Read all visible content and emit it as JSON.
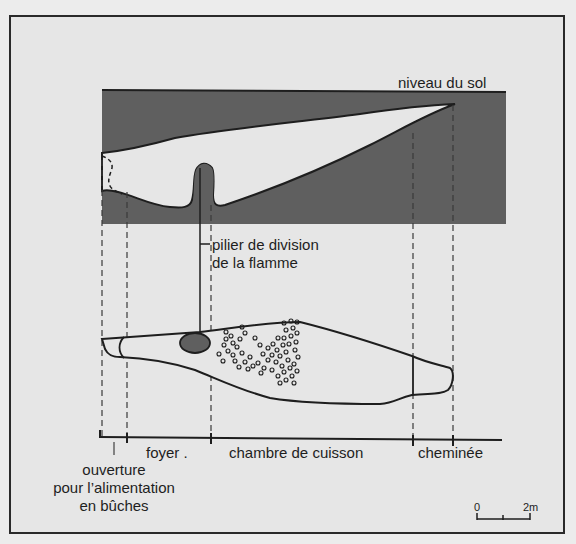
{
  "figure": {
    "type": "kiln cross-section and plan",
    "colors": {
      "earth": "#5f5f5f",
      "background": "#e6e6e6",
      "line": "#1e1e1e",
      "pillar": "#5f5f5f"
    }
  },
  "labels": {
    "ground_level": "niveau du sol",
    "pillar_line1": "pilier de division",
    "pillar_line2": "de la flamme",
    "foyer": "foyer .",
    "chamber": "chambre de cuisson",
    "chimney": "cheminée",
    "opening_line1": "ouverture",
    "opening_line2": "pour l’alimentation",
    "opening_line3": "en bûches"
  },
  "scale_bar": {
    "start_label": "0",
    "end_label": "2m"
  }
}
